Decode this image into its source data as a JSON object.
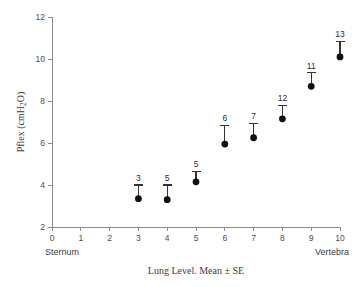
{
  "chart_data": {
    "type": "scatter",
    "title": "",
    "xlabel": "Lung Level. Mean ± SE",
    "ylabel": "Pflex (cmH2O)",
    "ylabel_parts": {
      "pre": "Pflex (cmH",
      "sub": "2",
      "post": "O)"
    },
    "xlim": [
      0,
      10
    ],
    "ylim": [
      2,
      12
    ],
    "x_ticks": [
      "0",
      "1",
      "2",
      "3",
      "4",
      "5",
      "6",
      "7",
      "8",
      "9",
      "10"
    ],
    "x_tick_values": [
      0,
      1,
      2,
      3,
      4,
      5,
      6,
      7,
      8,
      9,
      10
    ],
    "y_ticks": [
      "2",
      "4",
      "6",
      "8",
      "10",
      "12"
    ],
    "y_tick_values": [
      2,
      4,
      6,
      8,
      10,
      12
    ],
    "grid": false,
    "legend": "none",
    "error_bar_style": "upper-only-with-cap",
    "marker": "filled-circle",
    "marker_color": "#111111",
    "axis_color": "#8a8a8a",
    "x": [
      3,
      4,
      5,
      6,
      7,
      8,
      9,
      10
    ],
    "values": [
      3.35,
      3.3,
      4.15,
      5.95,
      6.25,
      7.15,
      8.7,
      10.1
    ],
    "error_upper": [
      0.65,
      0.7,
      0.5,
      0.9,
      0.7,
      0.65,
      0.65,
      0.75
    ],
    "point_labels": [
      "3",
      "5",
      "5",
      "6",
      "7",
      "12",
      "11",
      "13"
    ],
    "annotations": {
      "x_axis_start": "Sternum",
      "x_axis_end": "Vertebra"
    },
    "points": [
      {
        "x": 3,
        "y": 3.35,
        "err": 0.65,
        "n": "3"
      },
      {
        "x": 4,
        "y": 3.3,
        "err": 0.7,
        "n": "5"
      },
      {
        "x": 5,
        "y": 4.15,
        "err": 0.5,
        "n": "5"
      },
      {
        "x": 6,
        "y": 5.95,
        "err": 0.9,
        "n": "6"
      },
      {
        "x": 7,
        "y": 6.25,
        "err": 0.7,
        "n": "7"
      },
      {
        "x": 8,
        "y": 7.15,
        "err": 0.65,
        "n": "12"
      },
      {
        "x": 9,
        "y": 8.7,
        "err": 0.65,
        "n": "11"
      },
      {
        "x": 10,
        "y": 10.1,
        "err": 0.75,
        "n": "13"
      }
    ]
  }
}
